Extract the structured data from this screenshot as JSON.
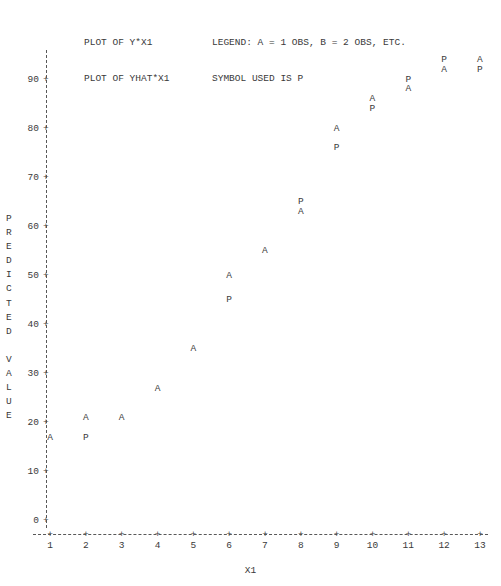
{
  "header": {
    "line1_left": "PLOT OF Y*X1",
    "line1_right": "LEGEND: A = 1 OBS, B = 2 OBS, ETC.",
    "line2_left": "PLOT OF YHAT*X1",
    "line2_right": "SYMBOL USED IS P"
  },
  "axes": {
    "y_title_chars": "P\nR\nE\nD\nI\nC\nT\nE\nD\n\nV\nA\nL\nU\nE",
    "y_title": "PREDICTED VALUE",
    "x_title": "X1",
    "y_ticks": [
      "0",
      "10",
      "20",
      "30",
      "40",
      "50",
      "60",
      "70",
      "80",
      "90"
    ],
    "x_ticks": [
      "1",
      "2",
      "3",
      "4",
      "5",
      "6",
      "7",
      "8",
      "9",
      "10",
      "11",
      "12",
      "13"
    ],
    "tick_glyph": "+"
  },
  "chart_data": {
    "type": "scatter",
    "xlabel": "X1",
    "ylabel": "PREDICTED VALUE",
    "xlim": [
      1,
      13
    ],
    "ylim": [
      0,
      95
    ],
    "grid": false,
    "legend": "LEGEND: A = 1 OBS, B = 2 OBS, ETC.",
    "symbol_note": "SYMBOL USED IS P",
    "series": [
      {
        "name": "Y (observed)",
        "symbol": "A",
        "x": [
          1,
          2,
          3,
          4,
          5,
          6,
          7,
          8,
          9,
          10,
          11,
          12,
          13
        ],
        "values": [
          17,
          21,
          21,
          27,
          35,
          50,
          55,
          63,
          80,
          86,
          88,
          92,
          94
        ]
      },
      {
        "name": "YHAT (predicted)",
        "symbol": "P",
        "x": [
          2,
          6,
          8,
          9,
          10,
          11,
          12,
          13
        ],
        "values": [
          17,
          45,
          65,
          76,
          84,
          90,
          94,
          92
        ]
      }
    ],
    "points": [
      {
        "symbol": "A",
        "x": 1,
        "y": 17
      },
      {
        "symbol": "A",
        "x": 2,
        "y": 21
      },
      {
        "symbol": "P",
        "x": 2,
        "y": 17
      },
      {
        "symbol": "A",
        "x": 3,
        "y": 21
      },
      {
        "symbol": "A",
        "x": 4,
        "y": 27
      },
      {
        "symbol": "A",
        "x": 5,
        "y": 35
      },
      {
        "symbol": "A",
        "x": 6,
        "y": 50
      },
      {
        "symbol": "P",
        "x": 6,
        "y": 45
      },
      {
        "symbol": "A",
        "x": 7,
        "y": 55
      },
      {
        "symbol": "P",
        "x": 8,
        "y": 65
      },
      {
        "symbol": "A",
        "x": 8,
        "y": 63
      },
      {
        "symbol": "A",
        "x": 9,
        "y": 80
      },
      {
        "symbol": "P",
        "x": 9,
        "y": 76
      },
      {
        "symbol": "A",
        "x": 10,
        "y": 86
      },
      {
        "symbol": "P",
        "x": 10,
        "y": 84
      },
      {
        "symbol": "P",
        "x": 11,
        "y": 90
      },
      {
        "symbol": "A",
        "x": 11,
        "y": 88
      },
      {
        "symbol": "P",
        "x": 12,
        "y": 94
      },
      {
        "symbol": "A",
        "x": 12,
        "y": 92
      },
      {
        "symbol": "A",
        "x": 13,
        "y": 94
      },
      {
        "symbol": "P",
        "x": 13,
        "y": 92
      }
    ]
  }
}
